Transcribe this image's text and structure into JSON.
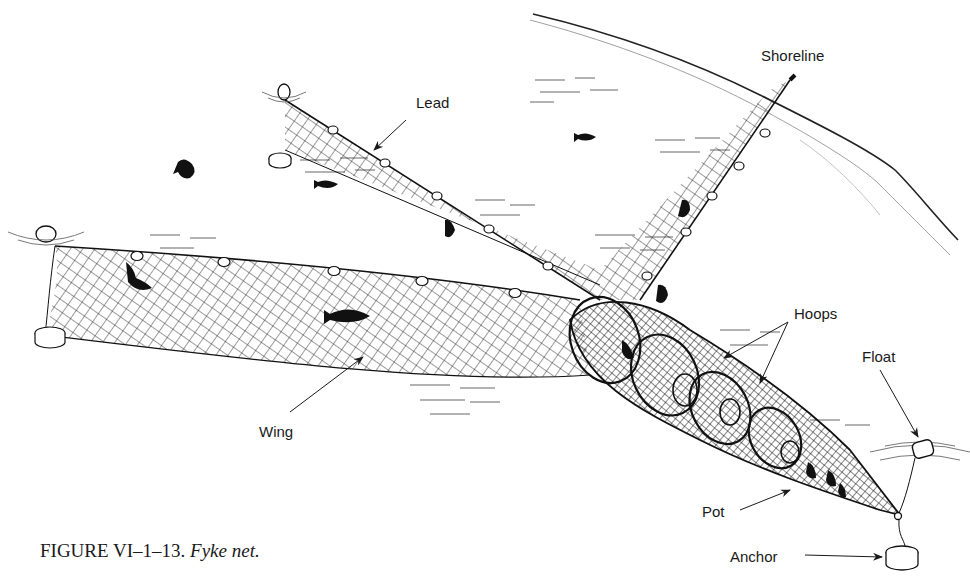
{
  "figure": {
    "caption_number": "FIGURE VI–1–13.",
    "caption_title": "Fyke net.",
    "ink_color": "#1a1a1a",
    "background": "#ffffff"
  },
  "labels": {
    "shoreline": "Shoreline",
    "lead": "Lead",
    "hoops": "Hoops",
    "float": "Float",
    "wing": "Wing",
    "pot": "Pot",
    "anchor": "Anchor"
  },
  "parts": [
    "shoreline",
    "lead",
    "wing",
    "hoops",
    "pot",
    "float",
    "anchor",
    "fish"
  ]
}
